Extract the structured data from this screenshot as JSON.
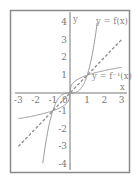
{
  "chart_data": {
    "type": "line",
    "title": "",
    "xlabel": "x",
    "ylabel": "y",
    "xlim": [
      -3,
      3
    ],
    "ylim": [
      -4,
      4
    ],
    "x_ticks": [
      "-3",
      "-2",
      "-1",
      "0",
      "1",
      "2",
      "3"
    ],
    "y_ticks": [
      "4",
      "3",
      "2",
      "1",
      "-1",
      "-2",
      "-3",
      "-4"
    ],
    "grid": false,
    "series": [
      {
        "name": "y = f(x)",
        "style": "solid",
        "x": [
          -1.58,
          -1.4,
          -1.2,
          -1,
          -0.6,
          -0.3,
          0,
          0.3,
          0.6,
          1,
          1.2,
          1.4,
          1.58
        ],
        "values": [
          -3.94,
          -2.74,
          -1.73,
          -1,
          -0.22,
          -0.03,
          0,
          0.03,
          0.22,
          1,
          1.73,
          2.74,
          3.94
        ]
      },
      {
        "name": "y = f⁻¹(x)",
        "style": "solid",
        "x": [
          -3,
          -2,
          -1,
          -0.5,
          -0.1,
          0,
          0.1,
          0.5,
          1,
          2,
          3
        ],
        "values": [
          -1.44,
          -1.26,
          -1,
          -0.79,
          -0.46,
          0,
          0.46,
          0.79,
          1,
          1.26,
          1.44
        ]
      },
      {
        "name": "y = x",
        "style": "dashed",
        "x": [
          -3,
          3
        ],
        "values": [
          -3,
          3
        ]
      }
    ],
    "annotations": [
      "y = f(x)",
      "y = f⁻¹(x)",
      "0"
    ]
  },
  "labels": {
    "x_axis": "x",
    "y_axis": "y",
    "f": "y = f(x)",
    "finv": "y = f⁻¹(x)",
    "origin": "0"
  },
  "colors": {
    "frame": "#8a8a8a",
    "axis": "#777777",
    "curve": "#9a9a9a",
    "dashed": "#8a8a8a",
    "text": "#777777"
  }
}
